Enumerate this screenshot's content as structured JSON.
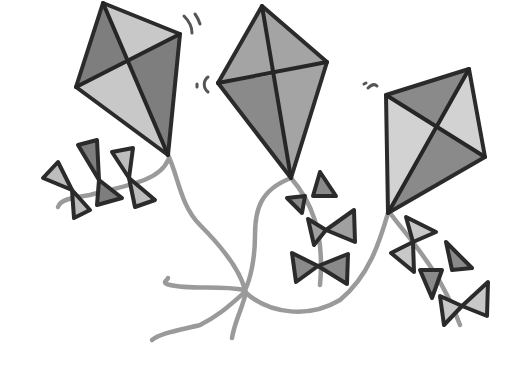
{
  "illustration": {
    "title": "Three kites with bow tails",
    "background": "#ffffff",
    "palette": {
      "outline": "#2b2b2b",
      "light": "#c8c8c8",
      "mid": "#a9a9a9",
      "dark": "#7e7e7e",
      "string": "#9a9a9a"
    },
    "kites": [
      {
        "name": "left-kite",
        "bows": 3
      },
      {
        "name": "middle-kite",
        "bows": 3
      },
      {
        "name": "right-kite",
        "bows": 3
      }
    ]
  }
}
